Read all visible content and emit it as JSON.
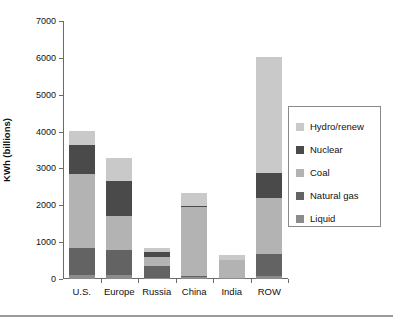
{
  "chart_data": {
    "type": "bar",
    "subtype": "stacked-bar",
    "title": "",
    "xlabel": "",
    "ylabel": "KWh (billions)",
    "ylim": [
      0,
      7000
    ],
    "ytick_values": [
      0,
      1000,
      2000,
      3000,
      4000,
      5000,
      6000,
      7000
    ],
    "ytick_labels": [
      "0",
      "1000",
      "2000",
      "3000",
      "4000",
      "5000",
      "6000",
      "7000"
    ],
    "grid": false,
    "legend_position": "right",
    "categories": [
      "U.S.",
      "Europe",
      "Russia",
      "China",
      "India",
      "ROW"
    ],
    "series": [
      {
        "name": "Liquid",
        "color": "#8c8c8c",
        "values": [
          120,
          100,
          30,
          60,
          25,
          90
        ]
      },
      {
        "name": "Natural gas",
        "color": "#636363",
        "values": [
          730,
          680,
          320,
          20,
          0,
          580
        ]
      },
      {
        "name": "Coal",
        "color": "#b3b3b3",
        "values": [
          2000,
          940,
          250,
          1870,
          480,
          1520
        ]
      },
      {
        "name": "Nuclear",
        "color": "#4a4a4a",
        "values": [
          800,
          950,
          130,
          30,
          20,
          700
        ]
      },
      {
        "name": "Hydro/renew",
        "color": "#c9c9c9",
        "values": [
          380,
          620,
          120,
          360,
          115,
          3140
        ]
      }
    ],
    "totals": [
      4030,
      3290,
      850,
      2340,
      640,
      6030
    ],
    "legend_order": [
      "Hydro/renew",
      "Nuclear",
      "Coal",
      "Natural gas",
      "Liquid"
    ]
  },
  "legend": {
    "entries": [
      {
        "label": "Hydro/renew",
        "color": "#c9c9c9"
      },
      {
        "label": "Nuclear",
        "color": "#4a4a4a"
      },
      {
        "label": "Coal",
        "color": "#b3b3b3"
      },
      {
        "label": "Natural gas",
        "color": "#636363"
      },
      {
        "label": "Liquid",
        "color": "#8c8c8c"
      }
    ]
  },
  "colors": {
    "axis": "#6b6b6b",
    "text": "#111111",
    "background": "#ffffff",
    "legend_border": "#8a8a8a",
    "rule": "#9a9a9a"
  }
}
